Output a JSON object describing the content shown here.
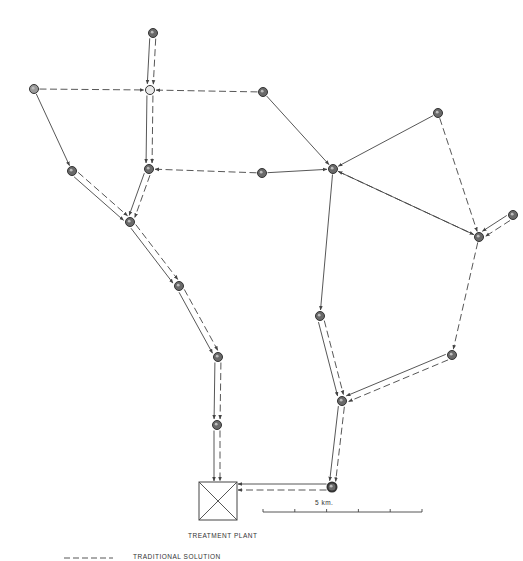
{
  "diagram": {
    "colors": {
      "line": "#444444",
      "node_fill": "#6a6a6a",
      "node_open_fill": "#e8e8e8",
      "background": "#ffffff"
    },
    "nodes": [
      {
        "id": "N1",
        "x": 153,
        "y": 33
      },
      {
        "id": "N2",
        "x": 150,
        "y": 90,
        "open": true
      },
      {
        "id": "N3",
        "x": 34,
        "y": 89,
        "light": true
      },
      {
        "id": "N4",
        "x": 263,
        "y": 92
      },
      {
        "id": "N5",
        "x": 72,
        "y": 171
      },
      {
        "id": "N6",
        "x": 149,
        "y": 169
      },
      {
        "id": "N7",
        "x": 262,
        "y": 173
      },
      {
        "id": "N8",
        "x": 333,
        "y": 169
      },
      {
        "id": "N9",
        "x": 438,
        "y": 113
      },
      {
        "id": "N10",
        "x": 130,
        "y": 222
      },
      {
        "id": "N11",
        "x": 479,
        "y": 237
      },
      {
        "id": "N12",
        "x": 513,
        "y": 215
      },
      {
        "id": "N13",
        "x": 179,
        "y": 286
      },
      {
        "id": "N14",
        "x": 320,
        "y": 316
      },
      {
        "id": "N15",
        "x": 218,
        "y": 357
      },
      {
        "id": "N16",
        "x": 452,
        "y": 355
      },
      {
        "id": "N17",
        "x": 342,
        "y": 401
      },
      {
        "id": "N18",
        "x": 217,
        "y": 425
      },
      {
        "id": "N19",
        "x": 332,
        "y": 487,
        "ring": true
      }
    ],
    "solid_edges": [
      [
        "N1",
        "N2"
      ],
      [
        "N2",
        "N6"
      ],
      [
        "N6",
        "N10"
      ],
      [
        "N3",
        "N5"
      ],
      [
        "N5",
        "N10"
      ],
      [
        "N10",
        "N13"
      ],
      [
        "N13",
        "N15"
      ],
      [
        "N15",
        "N18"
      ],
      [
        "N18",
        "PLANT"
      ],
      [
        "N4",
        "N8"
      ],
      [
        "N7",
        "N8"
      ],
      [
        "N9",
        "N8"
      ],
      [
        "N11",
        "N8"
      ],
      [
        "N12",
        "N11"
      ],
      [
        "N8",
        "N14"
      ],
      [
        "N14",
        "N17"
      ],
      [
        "N16",
        "N17"
      ],
      [
        "N17",
        "N19"
      ],
      [
        "N19",
        "PLANT"
      ]
    ],
    "dashed_edges": [
      [
        "N1",
        "N2"
      ],
      [
        "N3",
        "N2"
      ],
      [
        "N4",
        "N2"
      ],
      [
        "N2",
        "N6"
      ],
      [
        "N7",
        "N6"
      ],
      [
        "N6",
        "N10"
      ],
      [
        "N5",
        "N10"
      ],
      [
        "N10",
        "N13"
      ],
      [
        "N13",
        "N15"
      ],
      [
        "N15",
        "N18"
      ],
      [
        "N18",
        "PLANT"
      ],
      [
        "N8",
        "N11"
      ],
      [
        "N9",
        "N11"
      ],
      [
        "N12",
        "N11"
      ],
      [
        "N11",
        "N16"
      ],
      [
        "N16",
        "N17"
      ],
      [
        "N14",
        "N17"
      ],
      [
        "N17",
        "N19"
      ],
      [
        "N19",
        "PLANT"
      ]
    ],
    "plant": {
      "x": 199,
      "y": 482,
      "w": 38,
      "h": 38,
      "label": "TREATMENT  PLANT"
    },
    "scale_bar": {
      "label": "5 km.",
      "x1": 263,
      "x2": 422,
      "y": 512,
      "ticks": 6
    },
    "legend": [
      {
        "style": "dashed",
        "label": "TRADITIONAL  SOLUTION"
      }
    ]
  }
}
